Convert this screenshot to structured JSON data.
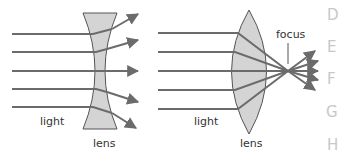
{
  "diagrams": {
    "concave": {
      "light_label": "light",
      "lens_label": "lens"
    },
    "convex": {
      "light_label": "light",
      "lens_label": "lens",
      "focus_label": "focus"
    }
  },
  "side_letters": [
    "D",
    "E",
    "F",
    "G",
    "H"
  ],
  "colors": {
    "ray": "#6b6b6b",
    "lens_fill": "#d4d4d4",
    "lens_stroke": "#555555",
    "text": "#333333",
    "side_letter": "#c8c8c8"
  }
}
